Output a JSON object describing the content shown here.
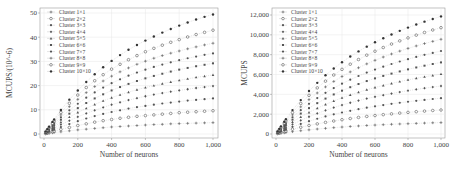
{
  "chart_data": [
    {
      "type": "scatter",
      "title": "",
      "xlabel": "Number of neurons",
      "ylabel": "MCUPS/(10^-6)",
      "xlim": [
        0,
        1000
      ],
      "ylim": [
        0,
        50
      ],
      "xticks": [
        "0",
        "200",
        "400",
        "600",
        "800",
        "1,000"
      ],
      "yticks": [
        "0",
        "10",
        "20",
        "30",
        "40",
        "50"
      ],
      "grid": true,
      "legend_position": "upper left",
      "x": [
        10,
        20,
        30,
        50,
        60,
        100,
        150,
        200,
        250,
        300,
        350,
        400,
        450,
        500,
        550,
        600,
        650,
        700,
        750,
        800,
        850,
        900,
        950,
        1000
      ],
      "series": [
        {
          "name": "Cluster 1×1",
          "values": [
            0.1,
            0.2,
            0.3,
            0.5,
            0.6,
            0.9,
            1.3,
            1.7,
            2.0,
            2.3,
            2.6,
            2.9,
            3.1,
            3.3,
            3.5,
            3.7,
            3.9,
            4.0,
            4.2,
            4.3,
            4.4,
            4.5,
            4.6,
            4.7
          ]
        },
        {
          "name": "Cluster 2×2",
          "values": [
            0.2,
            0.4,
            0.6,
            1.0,
            1.2,
            1.9,
            2.7,
            3.5,
            4.2,
            4.9,
            5.5,
            6.0,
            6.5,
            6.9,
            7.3,
            7.6,
            7.9,
            8.2,
            8.5,
            8.8,
            9.0,
            9.2,
            9.4,
            9.6
          ]
        },
        {
          "name": "Cluster 3×3",
          "values": [
            0.3,
            0.6,
            0.9,
            1.5,
            1.8,
            2.9,
            4.1,
            5.3,
            6.4,
            7.4,
            8.3,
            9.1,
            9.8,
            10.5,
            11.1,
            11.6,
            12.1,
            12.6,
            13.0,
            13.4,
            13.8,
            14.1,
            14.4,
            14.7
          ]
        },
        {
          "name": "Cluster 4×4",
          "values": [
            0.4,
            0.8,
            1.2,
            2.0,
            2.4,
            3.9,
            5.5,
            7.1,
            8.5,
            9.8,
            11.0,
            12.1,
            13.1,
            14.0,
            14.8,
            15.6,
            16.3,
            16.9,
            17.5,
            18.0,
            18.5,
            19.0,
            19.4,
            19.8
          ]
        },
        {
          "name": "Cluster 5×5",
          "values": [
            0.5,
            1.0,
            1.5,
            2.5,
            3.0,
            4.9,
            7.0,
            8.9,
            10.6,
            12.2,
            13.7,
            15.0,
            16.2,
            17.3,
            18.3,
            19.2,
            20.0,
            20.8,
            21.5,
            22.2,
            22.8,
            23.4,
            23.9,
            24.4
          ]
        },
        {
          "name": "Cluster 6×6",
          "values": [
            0.6,
            1.2,
            1.8,
            3.0,
            3.6,
            5.9,
            8.4,
            10.7,
            12.8,
            14.7,
            16.4,
            18.0,
            19.4,
            20.7,
            21.9,
            23.0,
            24.0,
            24.9,
            25.8,
            26.6,
            27.3,
            28.0,
            28.6,
            29.2
          ]
        },
        {
          "name": "Cluster 7×7",
          "values": [
            0.7,
            1.4,
            2.1,
            3.5,
            4.2,
            6.9,
            9.8,
            12.5,
            15.0,
            17.2,
            19.2,
            21.0,
            22.6,
            24.1,
            25.4,
            26.6,
            27.7,
            28.7,
            29.6,
            30.5,
            31.3,
            32.0,
            32.7,
            33.3
          ]
        },
        {
          "name": "Cluster 8×8",
          "values": [
            0.8,
            1.6,
            2.4,
            4.0,
            4.8,
            7.9,
            11.3,
            14.3,
            17.1,
            19.6,
            21.9,
            23.9,
            25.7,
            27.3,
            28.8,
            30.1,
            31.3,
            32.4,
            33.4,
            34.3,
            35.2,
            36.0,
            36.8,
            37.5
          ]
        },
        {
          "name": "Cluster 9×9",
          "values": [
            0.9,
            1.8,
            2.7,
            4.5,
            5.4,
            8.9,
            12.7,
            16.1,
            19.2,
            22.0,
            24.5,
            26.8,
            28.8,
            30.7,
            32.4,
            34.0,
            35.4,
            36.7,
            37.9,
            39.0,
            40.1,
            41.1,
            42.0,
            42.9
          ]
        },
        {
          "name": "Cluster 10×10",
          "values": [
            1.0,
            2.0,
            3.0,
            5.0,
            6.0,
            9.9,
            14.2,
            18.0,
            21.5,
            24.7,
            27.6,
            30.2,
            32.6,
            34.8,
            36.8,
            38.6,
            40.3,
            41.9,
            43.4,
            44.8,
            46.1,
            47.3,
            48.4,
            49.4
          ]
        }
      ]
    },
    {
      "type": "scatter",
      "title": "",
      "xlabel": "Number of neurons",
      "ylabel": "MCUPS",
      "xlim": [
        0,
        1000
      ],
      "ylim": [
        0,
        12000
      ],
      "xticks": [
        "0",
        "200",
        "400",
        "600",
        "800",
        "1,000"
      ],
      "yticks": [
        "0",
        "2,000",
        "4,000",
        "6,000",
        "8,000",
        "10,000",
        "12,000"
      ],
      "grid": true,
      "legend_position": "upper left",
      "x": [
        10,
        20,
        30,
        50,
        60,
        100,
        150,
        200,
        250,
        300,
        350,
        400,
        450,
        500,
        550,
        600,
        650,
        700,
        750,
        800,
        850,
        900,
        950,
        1000
      ],
      "series": [
        {
          "name": "Cluster 1×1",
          "values": [
            25,
            50,
            75,
            120,
            145,
            235,
            330,
            420,
            500,
            570,
            640,
            700,
            760,
            810,
            860,
            900,
            940,
            980,
            1010,
            1040,
            1070,
            1100,
            1130,
            1150
          ]
        },
        {
          "name": "Cluster 2×2",
          "values": [
            50,
            100,
            150,
            245,
            295,
            480,
            680,
            860,
            1020,
            1170,
            1310,
            1440,
            1560,
            1670,
            1770,
            1860,
            1950,
            2030,
            2110,
            2180,
            2250,
            2310,
            2370,
            2420
          ]
        },
        {
          "name": "Cluster 3×3",
          "values": [
            75,
            150,
            225,
            370,
            440,
            720,
            1020,
            1290,
            1540,
            1770,
            1980,
            2170,
            2340,
            2500,
            2650,
            2790,
            2920,
            3040,
            3150,
            3250,
            3350,
            3440,
            3530,
            3610
          ]
        },
        {
          "name": "Cluster 4×4",
          "values": [
            100,
            200,
            300,
            495,
            590,
            970,
            1370,
            1740,
            2070,
            2380,
            2660,
            2920,
            3150,
            3370,
            3570,
            3750,
            3920,
            4080,
            4230,
            4370,
            4500,
            4620,
            4730,
            4840
          ]
        },
        {
          "name": "Cluster 5×5",
          "values": [
            125,
            250,
            375,
            620,
            740,
            1210,
            1720,
            2180,
            2600,
            2980,
            3330,
            3650,
            3940,
            4210,
            4460,
            4690,
            4900,
            5100,
            5290,
            5460,
            5620,
            5770,
            5910,
            6040
          ]
        },
        {
          "name": "Cluster 6×6",
          "values": [
            150,
            300,
            450,
            740,
            890,
            1450,
            2060,
            2610,
            3110,
            3570,
            3990,
            4370,
            4720,
            5040,
            5340,
            5610,
            5860,
            6090,
            6310,
            6520,
            6710,
            6890,
            7060,
            7220
          ]
        },
        {
          "name": "Cluster 7×7",
          "values": [
            175,
            350,
            525,
            860,
            1030,
            1690,
            2400,
            3040,
            3620,
            4150,
            4630,
            5070,
            5480,
            5850,
            6190,
            6500,
            6790,
            7060,
            7310,
            7550,
            7770,
            7980,
            8180,
            8370
          ]
        },
        {
          "name": "Cluster 8×8",
          "values": [
            200,
            400,
            600,
            980,
            1180,
            1930,
            2740,
            3470,
            4140,
            4750,
            5300,
            5800,
            6260,
            6680,
            7070,
            7430,
            7760,
            8070,
            8360,
            8630,
            8880,
            9120,
            9340,
            9550
          ]
        },
        {
          "name": "Cluster 9×9",
          "values": [
            225,
            450,
            675,
            1110,
            1330,
            2170,
            3080,
            3900,
            4650,
            5330,
            5950,
            6520,
            7040,
            7510,
            7950,
            8350,
            8720,
            9070,
            9390,
            9690,
            9970,
            10240,
            10490,
            10720
          ]
        },
        {
          "name": "Cluster 10×10",
          "values": [
            250,
            500,
            750,
            1230,
            1480,
            2410,
            3420,
            4330,
            5160,
            5920,
            6610,
            7240,
            7810,
            8330,
            8810,
            9250,
            9660,
            10040,
            10400,
            10730,
            11040,
            11330,
            11600,
            11860
          ]
        }
      ]
    }
  ]
}
